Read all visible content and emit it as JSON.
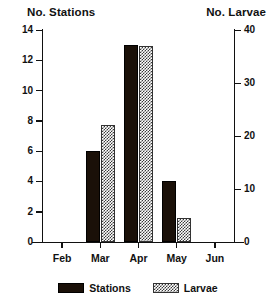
{
  "chart_data": {
    "type": "bar",
    "title": "",
    "categories": [
      "Feb",
      "Mar",
      "Apr",
      "May",
      "Jun"
    ],
    "series": [
      {
        "name": "Stations",
        "axis": "left",
        "values": [
          0,
          6,
          13,
          4,
          0
        ],
        "style": "solid-black"
      },
      {
        "name": "Larvae",
        "axis": "right",
        "values": [
          0,
          22,
          37,
          4.5,
          0
        ],
        "style": "hatched"
      }
    ],
    "xlabel": "",
    "ylabel": "No. Stations",
    "y2label": "No. Larvae",
    "ylim": [
      0,
      14
    ],
    "y2lim": [
      0,
      40
    ],
    "yticks": [
      0,
      2,
      4,
      6,
      8,
      10,
      12,
      14
    ],
    "y2ticks": [
      0,
      10,
      20,
      30,
      40
    ],
    "grid": false,
    "legend_position": "bottom-center"
  },
  "axes": {
    "left_caption": "No. Stations",
    "right_caption": "No. Larvae",
    "left_ticks": [
      "0",
      "2",
      "4",
      "6",
      "8",
      "10",
      "12",
      "14"
    ],
    "right_ticks": [
      "0",
      "10",
      "20",
      "30",
      "40"
    ],
    "category_labels": [
      "Feb",
      "Mar",
      "Apr",
      "May",
      "Jun"
    ]
  },
  "legend": {
    "items": [
      {
        "label": "Stations",
        "swatch": "solid-black-swatch"
      },
      {
        "label": "Larvae",
        "swatch": "hatched-swatch"
      }
    ]
  },
  "colors": {
    "bar_solid": "#1a1008",
    "bar_hatch_ink": "#3a3a3a",
    "axis": "#111111",
    "background": "#ffffff"
  }
}
